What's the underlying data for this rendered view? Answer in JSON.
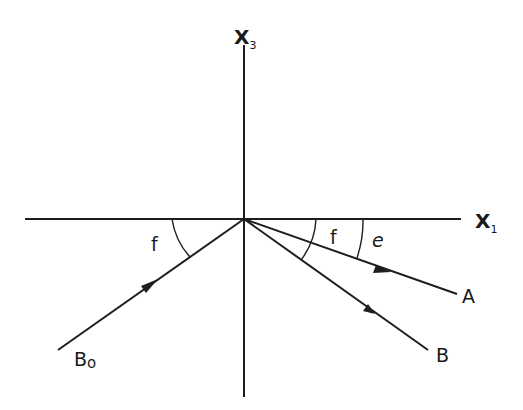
{
  "diagram": {
    "type": "ray-reflection-geometry",
    "origin": {
      "x": 244,
      "y": 219
    },
    "axes": {
      "horizontal": {
        "label": "X",
        "subscript": "1",
        "from": [
          25,
          219
        ],
        "to": [
          461,
          219
        ]
      },
      "vertical": {
        "label": "X",
        "subscript": "3",
        "from": [
          244,
          45
        ],
        "to": [
          244,
          397
        ]
      }
    },
    "rays": [
      {
        "id": "B0",
        "label": "B",
        "subscript": "o",
        "from": [
          58,
          350
        ],
        "to": [
          244,
          219
        ],
        "arrow_at": [
          157,
          280
        ],
        "direction": "incoming"
      },
      {
        "id": "A",
        "label": "A",
        "from": [
          244,
          219
        ],
        "to": [
          457,
          294
        ],
        "arrow_at": [
          385,
          270
        ],
        "direction": "outgoing"
      },
      {
        "id": "B",
        "label": "B",
        "from": [
          244,
          219
        ],
        "to": [
          428,
          350
        ],
        "arrow_at": [
          372,
          311
        ],
        "direction": "outgoing"
      }
    ],
    "angles": [
      {
        "label": "f",
        "between": [
          "X1 negative axis",
          "B0 ray"
        ],
        "side": "left"
      },
      {
        "label": "f",
        "between": [
          "X1 axis",
          "B ray"
        ],
        "side": "right"
      },
      {
        "label": "e",
        "between": [
          "X1 axis",
          "A ray"
        ],
        "side": "right"
      }
    ]
  },
  "labels": {
    "x3": "X",
    "x3_sub": "3",
    "x1": "X",
    "x1_sub": "1",
    "ray_a": "A",
    "ray_b": "B",
    "ray_b0": "B",
    "ray_b0_sub": "o",
    "angle_f_left": "f",
    "angle_f_right": "f",
    "angle_e": "e"
  }
}
